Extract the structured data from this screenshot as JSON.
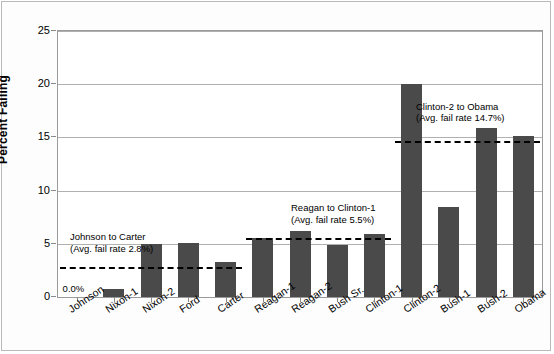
{
  "chart_data": {
    "type": "bar",
    "title": "",
    "xlabel": "",
    "ylabel": "Percent Failing",
    "ylim": [
      0,
      25
    ],
    "yticks": [
      0,
      5,
      10,
      15,
      20,
      25
    ],
    "ytick_labels": [
      "0",
      "5",
      "10",
      "15",
      "20",
      "25"
    ],
    "grid": true,
    "legend": "none",
    "bar_color": "#4a4a4a",
    "categories": [
      "Johnson",
      "Nixon-1",
      "Nixon-2",
      "Ford",
      "Carter",
      "Reagan-1",
      "Reagan-2",
      "Bush Sr.",
      "Clinton-1",
      "Clinton-2",
      "Bush-1",
      "Bush-2",
      "Obama"
    ],
    "values": [
      0.0,
      0.8,
      5.0,
      5.05,
      3.3,
      5.5,
      6.2,
      4.9,
      5.9,
      20.0,
      8.5,
      15.9,
      15.1
    ],
    "point_labels": [
      {
        "category": "Johnson",
        "text": "0.0%"
      }
    ],
    "annotations": [
      {
        "id": "johnson-to-carter",
        "line1": "Johnson to Carter",
        "line2": "(Avg. fail rate 2.8%)",
        "reference_value": 2.8,
        "span_categories": [
          "Johnson",
          "Carter"
        ],
        "style": "dashed"
      },
      {
        "id": "reagan-to-clinton-1",
        "line1": "Reagan to Clinton-1",
        "line2": "(Avg. fail rate 5.5%)",
        "reference_value": 5.5,
        "span_categories": [
          "Reagan-1",
          "Clinton-1"
        ],
        "style": "dashed"
      },
      {
        "id": "clinton-2-to-obama",
        "line1": "Clinton-2 to Obama",
        "line2": "(Avg. fail rate 14.7%)",
        "reference_value": 14.7,
        "span_categories": [
          "Clinton-2",
          "Obama"
        ],
        "style": "dashed"
      }
    ]
  }
}
